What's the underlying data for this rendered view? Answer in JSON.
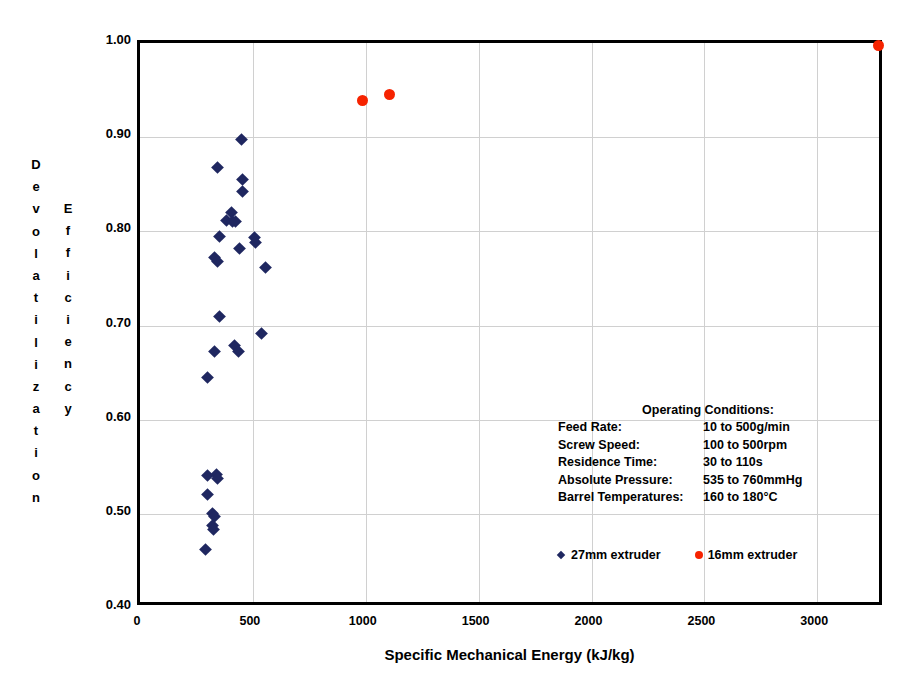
{
  "chart_data": {
    "type": "scatter",
    "title": "",
    "xlabel": "Specific Mechanical Energy (kJ/kg)",
    "ylabel": "Devolatilization Efficiency",
    "xlim": [
      0,
      3300
    ],
    "ylim": [
      0.4,
      1.0
    ],
    "xticks": [
      0,
      500,
      1000,
      1500,
      2000,
      2500,
      3000
    ],
    "xtick_labels": [
      "0",
      "500",
      "1000",
      "1500",
      "2000",
      "2500",
      "3000"
    ],
    "yticks": [
      0.4,
      0.5,
      0.6,
      0.7,
      0.8,
      0.9,
      1.0
    ],
    "ytick_labels": [
      "0.40",
      "0.50",
      "0.60",
      "0.70",
      "0.80",
      "0.90",
      "1.00"
    ],
    "grid": true,
    "legend_position": "inside-lower-right",
    "series": [
      {
        "name": "27mm extruder",
        "marker": "diamond",
        "color": "#1f2760",
        "points": [
          [
            450,
            0.897
          ],
          [
            345,
            0.868
          ],
          [
            452,
            0.855
          ],
          [
            452,
            0.842
          ],
          [
            405,
            0.82
          ],
          [
            385,
            0.812
          ],
          [
            408,
            0.81
          ],
          [
            425,
            0.81
          ],
          [
            352,
            0.795
          ],
          [
            505,
            0.793
          ],
          [
            512,
            0.788
          ],
          [
            440,
            0.782
          ],
          [
            330,
            0.772
          ],
          [
            345,
            0.768
          ],
          [
            557,
            0.762
          ],
          [
            352,
            0.71
          ],
          [
            540,
            0.692
          ],
          [
            330,
            0.672
          ],
          [
            420,
            0.679
          ],
          [
            438,
            0.672
          ],
          [
            300,
            0.645
          ],
          [
            300,
            0.541
          ],
          [
            340,
            0.542
          ],
          [
            345,
            0.537
          ],
          [
            300,
            0.521
          ],
          [
            320,
            0.5
          ],
          [
            332,
            0.497
          ],
          [
            322,
            0.488
          ],
          [
            325,
            0.483
          ],
          [
            288,
            0.462
          ]
        ]
      },
      {
        "name": "16mm extruder",
        "marker": "circle",
        "color": "#f62300",
        "points": [
          [
            985,
            0.939
          ],
          [
            1105,
            0.945
          ],
          [
            3270,
            0.997
          ]
        ]
      }
    ]
  },
  "annotation": {
    "title": "Operating Conditions:",
    "rows": [
      {
        "key": "Feed Rate:",
        "value": "10 to 500g/min"
      },
      {
        "key": "Screw Speed:",
        "value": "100 to 500rpm"
      },
      {
        "key": "Residence Time:",
        "value": "30 to 110s"
      },
      {
        "key": "Absolute Pressure:",
        "value": "535 to 760mmHg"
      },
      {
        "key": "Barrel Temperatures:",
        "value": "160 to 180°C"
      }
    ]
  },
  "legend": {
    "items": [
      {
        "label": "27mm extruder",
        "marker": "diamond",
        "color": "#1f2760"
      },
      {
        "label": "16mm extruder",
        "marker": "circle",
        "color": "#f62300"
      }
    ]
  },
  "ylabel_columns": {
    "column_1": "Devolatilization",
    "column_2": "Efficiency"
  }
}
